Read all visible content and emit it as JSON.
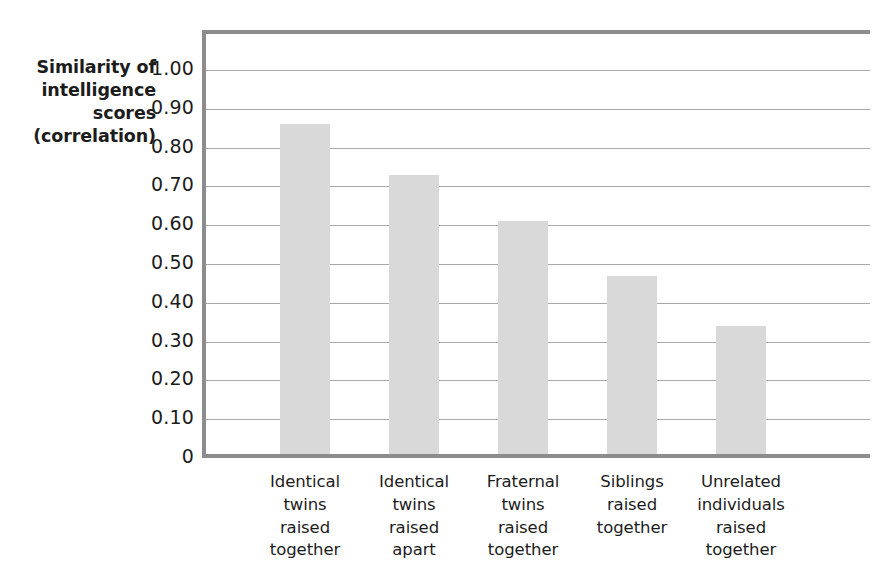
{
  "chart_data": {
    "type": "bar",
    "title": "",
    "subtitle": "",
    "xlabel": "",
    "ylabel": "Similarity of intelligence scores (correlation)",
    "ylabel_lines": [
      "Similarity of",
      "intelligence",
      "scores",
      "(correlation)"
    ],
    "categories": [
      "Identical twins raised together",
      "Identical twins raised apart",
      "Fraternal twins raised together",
      "Siblings raised together",
      "Unrelated individuals raised together"
    ],
    "category_lines": [
      [
        "Identical",
        "twins",
        "raised",
        "together"
      ],
      [
        "Identical",
        "twins",
        "raised",
        "apart"
      ],
      [
        "Fraternal",
        "twins",
        "raised",
        "together"
      ],
      [
        "Siblings",
        "raised",
        "together"
      ],
      [
        "Unrelated",
        "individuals",
        "raised",
        "together"
      ]
    ],
    "values": [
      0.85,
      0.72,
      0.6,
      0.46,
      0.33
    ],
    "ylim": [
      0,
      1.0
    ],
    "ytick_values": [
      1.0,
      0.9,
      0.8,
      0.7,
      0.6,
      0.5,
      0.4,
      0.3,
      0.2,
      0.1,
      0
    ],
    "ytick_labels": [
      "1.00",
      "0.90",
      "0.80",
      "0.70",
      "0.60",
      "0.50",
      "0.40",
      "0.30",
      "0.20",
      "0.10",
      "0"
    ],
    "grid": true,
    "legend": "none",
    "bar_color": "#d9d9d9",
    "axis_color": "#8c8c8c",
    "gridline_color": "#a9a9a9",
    "text_color": "#1c1c1c"
  }
}
